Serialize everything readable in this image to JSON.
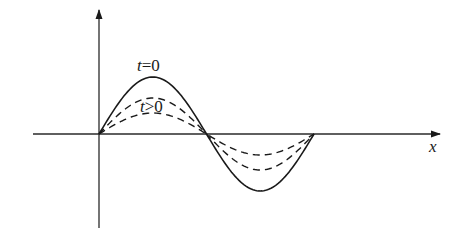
{
  "diagram": {
    "title": "",
    "type": "standing-wave-decay",
    "axes": {
      "x_label": "x",
      "y_label": ""
    },
    "labels": {
      "t_zero": "t=0",
      "t_zero_var": "t",
      "t_zero_rel": "=0",
      "t_later": "t>0",
      "t_later_var": "t",
      "t_later_rel": ">0"
    },
    "curves": [
      {
        "name": "t=0",
        "style": "solid",
        "amplitude_px": 57
      },
      {
        "name": "t>0 (early)",
        "style": "dashed",
        "amplitude_px": 36
      },
      {
        "name": "t>0 (later)",
        "style": "dashed",
        "amplitude_px": 21
      }
    ],
    "colors": {
      "ink": "#1a1a1a",
      "background": "#ffffff"
    }
  }
}
